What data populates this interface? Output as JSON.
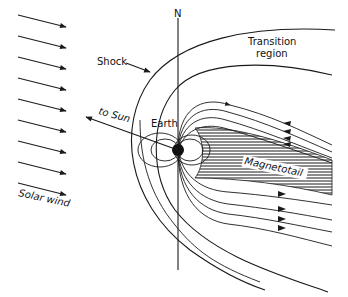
{
  "diagram": {
    "labels": {
      "north": "N",
      "transition_line1": "Transition",
      "transition_line2": "region",
      "shock": "Shock",
      "to_sun": "to Sun",
      "earth": "Earth",
      "magnetotail": "Magnetotail",
      "solar_wind": "Solar wind"
    },
    "solar_wind_arrow_count": 10,
    "colors": {
      "ink": "#1a1a1a",
      "background": "#ffffff"
    }
  }
}
